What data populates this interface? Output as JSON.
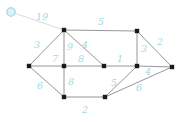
{
  "figure": {
    "width": 186,
    "height": 122,
    "background_color": "#ffffff",
    "label_color": "#9fd8e8",
    "edge_color": "#8a8a8a",
    "faint_edge_color": "#d7dde0",
    "node_color": "#1a1a1a",
    "highlight_node_fill": "#ddf1f6",
    "highlight_node_stroke": "#8fd3e2"
  },
  "chart_data": {
    "type": "diagram",
    "nodes": [
      {
        "id": "v0",
        "x": 11,
        "y": 12,
        "shape": "circle",
        "highlighted": true
      },
      {
        "id": "v1",
        "x": 64,
        "y": 30,
        "shape": "square",
        "highlighted": false
      },
      {
        "id": "v2",
        "x": 137,
        "y": 31,
        "shape": "square",
        "highlighted": false
      },
      {
        "id": "v3",
        "x": 29,
        "y": 66,
        "shape": "square",
        "highlighted": false
      },
      {
        "id": "v4",
        "x": 64,
        "y": 66,
        "shape": "square",
        "highlighted": false
      },
      {
        "id": "v5",
        "x": 104,
        "y": 66,
        "shape": "square",
        "highlighted": false
      },
      {
        "id": "v6",
        "x": 137,
        "y": 66,
        "shape": "square",
        "highlighted": false
      },
      {
        "id": "v7",
        "x": 172,
        "y": 67,
        "shape": "square",
        "highlighted": false
      },
      {
        "id": "v8",
        "x": 64,
        "y": 97,
        "shape": "square",
        "highlighted": false
      },
      {
        "id": "v9",
        "x": 105,
        "y": 97,
        "shape": "square",
        "highlighted": false
      }
    ],
    "edges": [
      {
        "id": "e-v0-v1",
        "from": "v0",
        "to": "v1",
        "weight": "19",
        "label_x": 42,
        "label_y": 17,
        "style": "faint"
      },
      {
        "id": "e-v1-v2",
        "from": "v1",
        "to": "v2",
        "weight": "5",
        "label_x": 101,
        "label_y": 22,
        "style": "solid"
      },
      {
        "id": "e-v3-v1",
        "from": "v3",
        "to": "v1",
        "weight": "3",
        "label_x": 37,
        "label_y": 45,
        "style": "solid"
      },
      {
        "id": "e-v3-v4",
        "from": "v3",
        "to": "v4",
        "weight": "7",
        "label_x": 55,
        "label_y": 59,
        "style": "solid"
      },
      {
        "id": "e-v1-v4",
        "from": "v1",
        "to": "v4",
        "weight": "9",
        "label_x": 70,
        "label_y": 47,
        "style": "solid"
      },
      {
        "id": "e-v1-v5",
        "from": "v1",
        "to": "v5",
        "weight": "4",
        "label_x": 85,
        "label_y": 45,
        "style": "solid"
      },
      {
        "id": "e-v4-v5",
        "from": "v4",
        "to": "v5",
        "weight": "8",
        "label_x": 81,
        "label_y": 59,
        "style": "solid"
      },
      {
        "id": "e-v5-v6",
        "from": "v5",
        "to": "v6",
        "weight": "1",
        "label_x": 120,
        "label_y": 59,
        "style": "solid"
      },
      {
        "id": "e-v2-v6",
        "from": "v2",
        "to": "v6",
        "weight": "3",
        "label_x": 144,
        "label_y": 49,
        "style": "solid"
      },
      {
        "id": "e-v2-v7",
        "from": "v2",
        "to": "v7",
        "weight": "2",
        "label_x": 160,
        "label_y": 42,
        "style": "solid"
      },
      {
        "id": "e-v3-v8",
        "from": "v3",
        "to": "v8",
        "weight": "6",
        "label_x": 40,
        "label_y": 86,
        "style": "solid"
      },
      {
        "id": "e-v4-v8",
        "from": "v4",
        "to": "v8",
        "weight": "8",
        "label_x": 71,
        "label_y": 82,
        "style": "solid"
      },
      {
        "id": "e-v8-v9",
        "from": "v8",
        "to": "v9",
        "weight": "2",
        "label_x": 85,
        "label_y": 110,
        "style": "solid"
      },
      {
        "id": "e-v9-v6",
        "from": "v9",
        "to": "v6",
        "weight": "5",
        "label_x": 114,
        "label_y": 83,
        "style": "solid"
      },
      {
        "id": "e-v6-v7",
        "from": "v6",
        "to": "v7",
        "weight": "4",
        "label_x": 148,
        "label_y": 72,
        "style": "solid"
      },
      {
        "id": "e-v9-v7",
        "from": "v9",
        "to": "v7",
        "weight": "6",
        "label_x": 139,
        "label_y": 88,
        "style": "solid"
      }
    ]
  }
}
